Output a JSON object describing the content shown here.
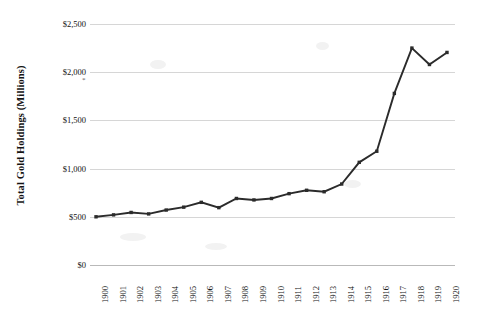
{
  "chart_data": {
    "type": "line",
    "title": "",
    "xlabel": "",
    "ylabel": "Total Gold Holdings (Millions)",
    "categories": [
      "1900",
      "1901",
      "1902",
      "1903",
      "1904",
      "1905",
      "1906",
      "1907",
      "1908",
      "1909",
      "1910",
      "1911",
      "1912",
      "1913",
      "1914",
      "1915",
      "1916",
      "1917",
      "1918",
      "1919",
      "1920"
    ],
    "values": [
      500,
      520,
      545,
      530,
      570,
      600,
      650,
      595,
      690,
      675,
      690,
      740,
      775,
      760,
      840,
      1065,
      1180,
      1780,
      2250,
      2080,
      2205
    ],
    "series": [
      {
        "name": "Total Gold Holdings",
        "values": [
          500,
          520,
          545,
          530,
          570,
          600,
          650,
          595,
          690,
          675,
          690,
          740,
          775,
          760,
          840,
          1065,
          1180,
          1780,
          2250,
          2080,
          2205
        ]
      }
    ],
    "ylim": [
      0,
      2500
    ],
    "ytick_values": [
      0,
      500,
      1000,
      1500,
      2000,
      2500
    ],
    "ytick_labels": [
      "$0",
      "$500",
      "$1,000",
      "$1,500",
      "$2,000",
      "$2,500"
    ],
    "grid": true,
    "legend": false,
    "legend_position": "none",
    "annotations": [
      "*"
    ],
    "line_color": "#2b2b2b",
    "gridline_color": "#d6d6d6",
    "background_color": "#ffffff"
  }
}
